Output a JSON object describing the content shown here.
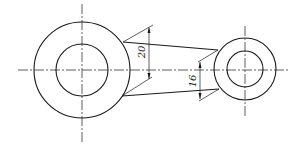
{
  "drawing": {
    "type": "mechanical link (two bosses joined by tapered web)",
    "colors": {
      "line": "#1a1a1a",
      "background": "#ffffff"
    },
    "dimensions": [
      {
        "id": "dim-left",
        "label": "20"
      },
      {
        "id": "dim-right",
        "label": "16"
      }
    ]
  }
}
